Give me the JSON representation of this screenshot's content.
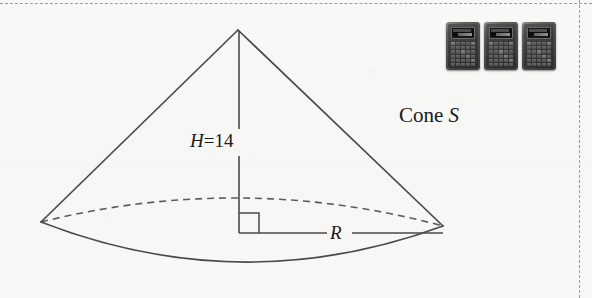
{
  "figure": {
    "shape": "cone",
    "labels": {
      "height": {
        "variable": "H",
        "equals": "=",
        "value": "14",
        "text": "H = 14"
      },
      "radius": {
        "variable": "R",
        "text": "R"
      },
      "name": {
        "prefix": "Cone ",
        "identifier": "S",
        "text": "Cone S"
      }
    },
    "annotations": {
      "right_angle_marker": "right-angle-square",
      "hidden_base_edge": "dashed",
      "visible_base_edge": "solid"
    },
    "colors": {
      "outline": "#4a4a4a",
      "hidden_outline": "#5a5a5a",
      "background": "#f7f7f5",
      "text": "#1a1a1a",
      "frame": "#9b9b9b"
    },
    "geometry": {
      "apex": {
        "x": 238,
        "y": 30
      },
      "base_center": {
        "x": 242,
        "y": 233
      },
      "base_semi_major_px": 201,
      "base_semi_minor_px": 35
    }
  },
  "calculators": {
    "count": 3,
    "items": [
      {
        "name": "calculator-1"
      },
      {
        "name": "calculator-2"
      },
      {
        "name": "calculator-3"
      }
    ]
  }
}
